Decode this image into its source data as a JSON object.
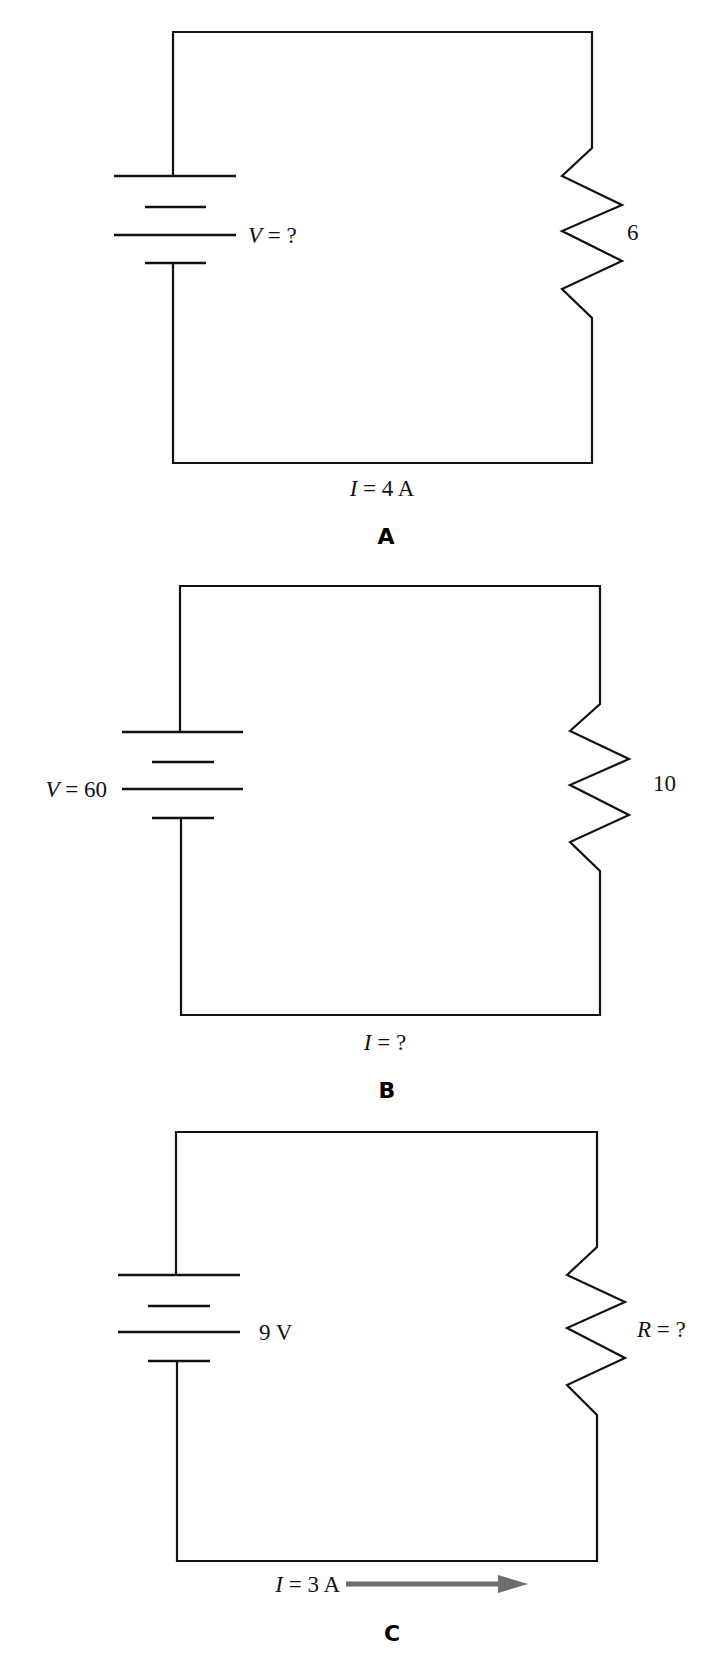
{
  "colors": {
    "wire": "#111111",
    "arrow": "#6e6e6e",
    "background": "#ffffff"
  },
  "circuits": [
    {
      "caption": "A",
      "battery_label": {
        "var": "V",
        "rest": " = ?"
      },
      "resistor_label": {
        "var": "",
        "rest": "6"
      },
      "current_label": {
        "var": "I",
        "rest": " = 4 A"
      },
      "has_current_arrow": false
    },
    {
      "caption": "B",
      "battery_label": {
        "var": "V",
        "rest": " = 60"
      },
      "resistor_label": {
        "var": "",
        "rest": "10"
      },
      "current_label": {
        "var": "I",
        "rest": " = ?"
      },
      "has_current_arrow": false
    },
    {
      "caption": "C",
      "battery_label": {
        "var": "",
        "rest": "9 V"
      },
      "resistor_label": {
        "var": "R",
        "rest": " = ?"
      },
      "current_label": {
        "var": "I",
        "rest": " = 3 A"
      },
      "has_current_arrow": true
    }
  ]
}
